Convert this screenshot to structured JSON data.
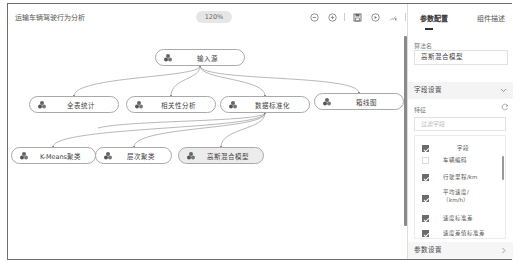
{
  "app": {
    "title": "运输车辆驾驶行为分析",
    "zoom_level": "120%"
  },
  "toolbar": {
    "icons": [
      "zoom-out-icon",
      "zoom-in-icon",
      "save-icon",
      "run-icon",
      "chart-icon",
      "clipboard-icon"
    ]
  },
  "canvas": {
    "nodes": [
      {
        "id": "input",
        "label": "输入源",
        "x": 147,
        "y": 19,
        "w": 90
      },
      {
        "id": "stats",
        "label": "全表统计",
        "x": 21,
        "y": 66,
        "w": 90
      },
      {
        "id": "corr",
        "label": "相关性分析",
        "x": 118,
        "y": 66,
        "w": 90
      },
      {
        "id": "norm",
        "label": "数据标准化",
        "x": 212,
        "y": 66,
        "w": 90
      },
      {
        "id": "box",
        "label": "箱线图",
        "x": 306,
        "y": 63,
        "w": 90
      },
      {
        "id": "kmeans",
        "label": "K-Means聚类",
        "x": 3,
        "y": 117,
        "w": 85
      },
      {
        "id": "hier",
        "label": "层次聚类",
        "x": 87,
        "y": 117,
        "w": 77
      },
      {
        "id": "gmm",
        "label": "高斯混合模型",
        "x": 170,
        "y": 117,
        "w": 86,
        "selected": true
      }
    ]
  },
  "panel": {
    "tabs": [
      {
        "label": "参数配置",
        "active": true
      },
      {
        "label": "组件描述",
        "active": false
      }
    ],
    "algorithm_name_label": "算法名",
    "algorithm_name_value": "高斯混合模型",
    "field_settings_label": "字段设置",
    "feature_label": "特征",
    "filter_placeholder": "过滤字段",
    "field_header": "字段",
    "fields": [
      {
        "label": "车辆编码",
        "checked": false
      },
      {
        "label": "行驶里程/km",
        "checked": true
      },
      {
        "label": "平均速度/（km/h）",
        "checked": true
      },
      {
        "label": "速度标准差",
        "checked": true
      },
      {
        "label": "速度差值标准差",
        "checked": true
      }
    ],
    "param_settings_label": "参数设置"
  }
}
